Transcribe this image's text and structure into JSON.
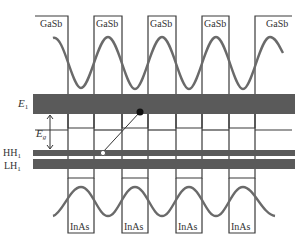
{
  "diagram": {
    "barrier_labels": [
      "GaSb",
      "GaSb",
      "GaSb",
      "GaSb",
      "GaSb"
    ],
    "well_labels": [
      "InAs",
      "InAs",
      "InAs",
      "InAs"
    ],
    "levels": {
      "e1": {
        "label": "E",
        "sub": "1"
      },
      "hh1": {
        "label": "HH",
        "sub": "1"
      },
      "lh1": {
        "label": "LH",
        "sub": "1"
      },
      "eg": {
        "label": "E",
        "sub": "g"
      }
    },
    "colors": {
      "band": "#5a5a5a",
      "line": "#3a3a3a",
      "wave": "#6a6a6a",
      "text": "#333333"
    }
  }
}
